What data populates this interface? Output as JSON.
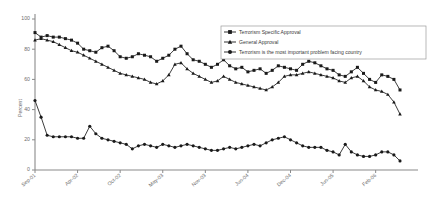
{
  "chart_data": {
    "type": "line",
    "title": "",
    "xlabel": "",
    "ylabel": "Percent",
    "ylim": [
      0,
      100
    ],
    "yticks": [
      0,
      20,
      40,
      60,
      80,
      100
    ],
    "grid": false,
    "legend_position": "top-right",
    "xticks": [
      "Sep-01",
      "Apr-02",
      "Oct-02",
      "May-03",
      "Nov-03",
      "Jun-04",
      "Dec-04",
      "Jun-05",
      "Feb-06"
    ],
    "xtick_indices": [
      0,
      7,
      14,
      21,
      28,
      35,
      42,
      49,
      56
    ],
    "x_count": 61,
    "series": [
      {
        "name": "Terrorism Specific Approval",
        "marker": "square",
        "values": [
          91,
          88,
          89,
          88,
          88,
          87,
          86,
          84,
          80,
          79,
          78,
          81,
          82,
          79,
          75,
          74,
          75,
          77,
          76,
          75,
          72,
          74,
          76,
          80,
          82,
          77,
          73,
          72,
          70,
          68,
          70,
          73,
          69,
          67,
          68,
          65,
          66,
          67,
          64,
          66,
          69,
          68,
          67,
          66,
          70,
          72,
          71,
          69,
          67,
          66,
          63,
          62,
          65,
          68,
          64,
          60,
          58,
          63,
          62,
          60,
          53
        ]
      },
      {
        "name": "General Approval",
        "marker": "triangle",
        "values": [
          86,
          87,
          86,
          85,
          83,
          81,
          79,
          78,
          76,
          74,
          72,
          70,
          68,
          66,
          64,
          63,
          62,
          61,
          60,
          58,
          57,
          59,
          63,
          70,
          71,
          67,
          64,
          62,
          60,
          58,
          59,
          62,
          60,
          58,
          57,
          56,
          55,
          54,
          53,
          55,
          58,
          62,
          63,
          63,
          64,
          65,
          64,
          63,
          62,
          61,
          59,
          58,
          61,
          62,
          59,
          55,
          53,
          52,
          50,
          45,
          37
        ]
      },
      {
        "name": "Terrorism is the most important problem facing country",
        "marker": "circle",
        "values": [
          46,
          35,
          23,
          22,
          22,
          22,
          22,
          21,
          21,
          29,
          24,
          21,
          20,
          19,
          18,
          17,
          14,
          16,
          17,
          16,
          15,
          17,
          16,
          15,
          16,
          17,
          16,
          15,
          14,
          13,
          13,
          14,
          15,
          14,
          15,
          16,
          17,
          16,
          18,
          20,
          21,
          22,
          20,
          18,
          16,
          15,
          15,
          15,
          13,
          12,
          10,
          17,
          12,
          10,
          9,
          9,
          10,
          12,
          12,
          10,
          6
        ]
      }
    ]
  },
  "legend": {
    "items": [
      {
        "label": "Terrorism Specific Approval"
      },
      {
        "label": "General Approval"
      },
      {
        "label": "Terrorism is the most important problem facing country"
      }
    ]
  }
}
